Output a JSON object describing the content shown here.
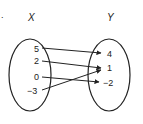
{
  "diagram": {
    "type": "mapping",
    "bullet": ".",
    "domain_set": {
      "name": "X",
      "values": [
        "5",
        "2",
        "0",
        "−3"
      ]
    },
    "range_set": {
      "name": "Y",
      "values": [
        "4",
        "1",
        "−2"
      ]
    },
    "mappings": [
      {
        "from": "5",
        "to": "4"
      },
      {
        "from": "2",
        "to": "1"
      },
      {
        "from": "0",
        "to": "−2"
      },
      {
        "from": "−3",
        "to": "1"
      }
    ]
  }
}
